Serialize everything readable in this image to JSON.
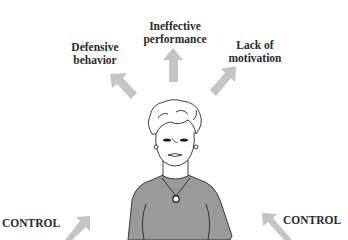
{
  "figure": {
    "title_clipped": "",
    "outcomes": [
      {
        "id": "defensive",
        "line1": "Defensive",
        "line2": "behavior"
      },
      {
        "id": "ineffective",
        "line1": "Ineffective",
        "line2": "performance"
      },
      {
        "id": "motivation",
        "line1": "Lack of",
        "line2": "motivation"
      }
    ],
    "inputs": [
      {
        "id": "control-left",
        "label": "CONTROL"
      },
      {
        "id": "control-right",
        "label": "CONTROL"
      }
    ],
    "colors": {
      "arrow": "#c4c4c4",
      "shirt": "#9a9a9a",
      "line": "#2a2a2a",
      "text": "#2a2a2a",
      "background": "#ffffff"
    }
  }
}
